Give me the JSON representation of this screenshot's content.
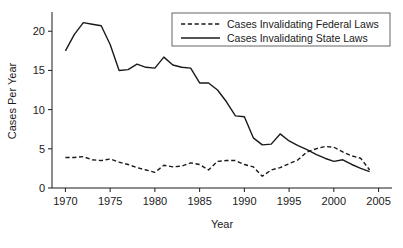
{
  "chart_data": {
    "type": "line",
    "title": "",
    "xlabel": "Year",
    "ylabel": "Cases Per Year",
    "xlim": [
      1968.5,
      2006.5
    ],
    "ylim": [
      0,
      22.2
    ],
    "xticks": [
      1970,
      1975,
      1980,
      1985,
      1990,
      1995,
      2000,
      2005
    ],
    "yticks": [
      0,
      5,
      10,
      15,
      20
    ],
    "grid": false,
    "legend_position": "top-right",
    "x": [
      1970,
      1971,
      1972,
      1973,
      1974,
      1975,
      1976,
      1977,
      1978,
      1979,
      1980,
      1981,
      1982,
      1983,
      1984,
      1985,
      1986,
      1987,
      1988,
      1989,
      1990,
      1991,
      1992,
      1993,
      1994,
      1995,
      1996,
      1997,
      1998,
      1999,
      2000,
      2001,
      2002,
      2003,
      2004
    ],
    "series": [
      {
        "name": "Cases Invalidating Federal Laws",
        "style": "dashed",
        "color": "#1a1a1a",
        "values": [
          3.9,
          3.9,
          4.0,
          3.6,
          3.5,
          3.7,
          3.3,
          3.0,
          2.6,
          2.3,
          2.0,
          2.9,
          2.7,
          2.8,
          3.2,
          3.0,
          2.3,
          3.4,
          3.5,
          3.5,
          3.0,
          2.7,
          1.5,
          2.3,
          2.6,
          3.1,
          3.6,
          4.6,
          5.0,
          5.3,
          5.2,
          4.6,
          4.1,
          3.8,
          2.3
        ]
      },
      {
        "name": "Cases Invalidating State Laws",
        "style": "solid",
        "color": "#1a1a1a",
        "values": [
          17.5,
          19.6,
          21.1,
          20.9,
          20.7,
          18.3,
          15.0,
          15.1,
          15.8,
          15.4,
          15.3,
          16.7,
          15.7,
          15.4,
          15.3,
          13.4,
          13.4,
          12.5,
          11.0,
          9.2,
          9.1,
          6.4,
          5.5,
          5.6,
          6.9,
          6.0,
          5.4,
          4.9,
          4.3,
          3.8,
          3.4,
          3.6,
          3.0,
          2.5,
          2.1
        ]
      }
    ]
  },
  "axes": {
    "ylabel": "Cases Per Year",
    "xlabel": "Year",
    "xtick_labels": [
      "1970",
      "1975",
      "1980",
      "1985",
      "1990",
      "1995",
      "2000",
      "2005"
    ],
    "ytick_labels": [
      "0",
      "5",
      "10",
      "15",
      "20"
    ]
  },
  "legend": {
    "entries": [
      {
        "label": "Cases Invalidating Federal Laws",
        "style": "dashed"
      },
      {
        "label": "Cases Invalidating State Laws",
        "style": "solid"
      }
    ]
  }
}
